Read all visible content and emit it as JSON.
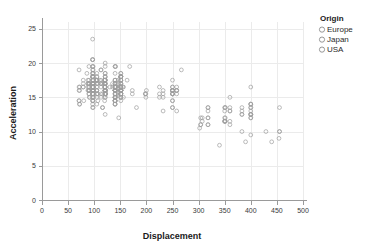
{
  "chart_data": {
    "type": "scatter",
    "title": "",
    "xlabel": "Displacement",
    "ylabel": "Acceleration",
    "xlim": [
      0,
      500
    ],
    "ylim": [
      0,
      26
    ],
    "xticks": [
      0,
      50,
      100,
      150,
      200,
      250,
      300,
      350,
      400,
      450,
      500
    ],
    "yticks": [
      0,
      5,
      10,
      15,
      20,
      25
    ],
    "xtick_labels": [
      "0",
      "50",
      "100",
      "150",
      "200",
      "250",
      "300",
      "350",
      "400",
      "450",
      "500"
    ],
    "ytick_labels": [
      "0",
      "5",
      "10",
      "15",
      "20",
      "25"
    ],
    "grid": true,
    "legend_position": "right",
    "legend_title": "Origin",
    "legend_entries": [
      "Europe",
      "Japan",
      "USA"
    ],
    "marker": "open-circle",
    "marker_color": "#9e9e9e",
    "axis_color": "#9a9a9a",
    "grid_color": "#ebebeb",
    "point_count": 392,
    "x": [
      307,
      350,
      318,
      304,
      302,
      429,
      454,
      440,
      455,
      390,
      383,
      340,
      400,
      455,
      113,
      198,
      199,
      200,
      97,
      97,
      110,
      107,
      104,
      121,
      199,
      360,
      307,
      318,
      304,
      97,
      140,
      113,
      98,
      232,
      225,
      250,
      198,
      97,
      80,
      97,
      88,
      304,
      350,
      318,
      351,
      267,
      360,
      400,
      400,
      113,
      97,
      71,
      97,
      113,
      98,
      97,
      97,
      140,
      147,
      400,
      455,
      360,
      351,
      360,
      350,
      318,
      383,
      400,
      400,
      400,
      258,
      140,
      250,
      250,
      250,
      122,
      116,
      79,
      88,
      71,
      72,
      97,
      91,
      113,
      97,
      97,
      98,
      97,
      97,
      97,
      97,
      97,
      97,
      120,
      181,
      250,
      232,
      350,
      400,
      351,
      318,
      383,
      400,
      400,
      258,
      140,
      250,
      250,
      250,
      122,
      116,
      79,
      88,
      71,
      72,
      97,
      91,
      113,
      97,
      98,
      97,
      97,
      140,
      140,
      140,
      140,
      140,
      140,
      140,
      140,
      232,
      225,
      250,
      250,
      258,
      360,
      350,
      351,
      318,
      383,
      400,
      400,
      258,
      140,
      250,
      250,
      250,
      122,
      116,
      79,
      88,
      71,
      72,
      97,
      91,
      113,
      97,
      98,
      97,
      97,
      140,
      98,
      97,
      97,
      97,
      140,
      140,
      140,
      140,
      140,
      140,
      140,
      140,
      232,
      225,
      250,
      250,
      258,
      360,
      350,
      351,
      318,
      383,
      400,
      400,
      258,
      140,
      250,
      250,
      250,
      122,
      116,
      79,
      88,
      71,
      72,
      97,
      91,
      113,
      97,
      98,
      97,
      97,
      140,
      98,
      97,
      97,
      97,
      140,
      140,
      140,
      140,
      155,
      151,
      121,
      121,
      156,
      173,
      173,
      151,
      98,
      151,
      156,
      151,
      105,
      98,
      151,
      140,
      151,
      105,
      98,
      97,
      90,
      90,
      140,
      151,
      140,
      151,
      121,
      121,
      121,
      121,
      141,
      121,
      121,
      151,
      151,
      151,
      105,
      98,
      151,
      146,
      151,
      140,
      105,
      98,
      151,
      140,
      151,
      105,
      98,
      97,
      90,
      90,
      120,
      151,
      140,
      151,
      121,
      121,
      121,
      121,
      141,
      121,
      121,
      151,
      151,
      105,
      98,
      151,
      146,
      151,
      140,
      105,
      98,
      151,
      140,
      151,
      105,
      98,
      97,
      90,
      90,
      120,
      151,
      140,
      151,
      121,
      121,
      121,
      121,
      141,
      121,
      121,
      151,
      163,
      151,
      105,
      98,
      151,
      146,
      151,
      140,
      105,
      98,
      151,
      140,
      151,
      105,
      98,
      97,
      90,
      90,
      120,
      151,
      140,
      151,
      121,
      121,
      121,
      121,
      141,
      121,
      121,
      151,
      168,
      151,
      105,
      98,
      151,
      146,
      151,
      140,
      105,
      98,
      151,
      140,
      151,
      105,
      98,
      97,
      90,
      90,
      120,
      151,
      140,
      151,
      121,
      121,
      121,
      107,
      141,
      121,
      121,
      151,
      135,
      151,
      105,
      98,
      151,
      146,
      151,
      140,
      105,
      98,
      151,
      140,
      151,
      105,
      98,
      97,
      90,
      86,
      120,
      151,
      140,
      151,
      121,
      121,
      121,
      107,
      141,
      121,
      130,
      151,
      135,
      151,
      105,
      98,
      151,
      146,
      151,
      140,
      105,
      98,
      151,
      140,
      151,
      105,
      98,
      97,
      90,
      86,
      120,
      151,
      140,
      151,
      121,
      121,
      121,
      107,
      141,
      121,
      130,
      151,
      135,
      151,
      105,
      98,
      151,
      146,
      151,
      140,
      105,
      98,
      151,
      140,
      151,
      105,
      98,
      97,
      90,
      86,
      120,
      151,
      140,
      151,
      121
    ],
    "y": [
      12.0,
      11.5,
      11.0,
      12.0,
      10.5,
      10.0,
      9.0,
      8.5,
      10.0,
      8.5,
      10.0,
      8.0,
      9.5,
      10.0,
      15.0,
      15.5,
      15.5,
      16.0,
      14.5,
      20.5,
      17.5,
      14.5,
      17.5,
      12.5,
      15.0,
      13.5,
      11.5,
      11.0,
      11.0,
      20.5,
      14.0,
      19.0,
      15.0,
      13.0,
      15.5,
      15.5,
      15.5,
      19.0,
      14.5,
      19.5,
      16.5,
      11.0,
      12.0,
      12.0,
      13.5,
      19.0,
      15.0,
      14.0,
      14.0,
      19.0,
      18.0,
      19.0,
      20.5,
      15.5,
      17.0,
      23.5,
      19.5,
      16.5,
      12.0,
      12.0,
      13.5,
      13.0,
      11.5,
      11.0,
      13.5,
      13.5,
      12.5,
      13.5,
      12.5,
      14.0,
      16.0,
      14.0,
      14.5,
      13.5,
      16.0,
      15.5,
      13.5,
      16.5,
      17.0,
      14.5,
      14.0,
      17.0,
      15.0,
      17.0,
      16.0,
      18.5,
      13.5,
      16.5,
      17.0,
      14.5,
      14.0,
      17.0,
      15.0,
      14.5,
      13.5,
      17.5,
      15.5,
      13.0,
      12.0,
      13.5,
      13.0,
      12.5,
      13.5,
      12.5,
      16.0,
      14.0,
      14.5,
      13.5,
      16.0,
      15.5,
      13.5,
      16.5,
      17.0,
      14.5,
      14.0,
      17.0,
      15.0,
      17.0,
      16.0,
      18.5,
      13.5,
      16.5,
      15.5,
      17.5,
      14.5,
      15.0,
      16.5,
      14.5,
      16.5,
      15.0,
      16.0,
      15.0,
      16.5,
      15.5,
      16.0,
      13.0,
      11.5,
      11.5,
      12.0,
      13.5,
      13.0,
      12.5,
      16.5,
      15.5,
      16.5,
      15.5,
      16.0,
      16.0,
      15.5,
      17.0,
      17.5,
      16.0,
      16.5,
      16.0,
      17.0,
      16.5,
      17.5,
      16.0,
      18.0,
      17.5,
      15.5,
      16.5,
      17.0,
      16.5,
      15.5,
      16.0,
      14.5,
      15.0,
      16.0,
      14.5,
      16.5,
      15.0,
      16.0,
      15.0,
      16.5,
      15.5,
      16.0,
      13.0,
      11.5,
      11.5,
      12.0,
      13.5,
      13.0,
      12.5,
      16.5,
      15.5,
      16.5,
      15.5,
      16.0,
      16.0,
      15.5,
      17.0,
      17.5,
      16.0,
      16.5,
      16.0,
      17.0,
      16.5,
      17.5,
      16.0,
      18.0,
      17.5,
      15.5,
      16.5,
      17.0,
      16.5,
      15.5,
      16.0,
      14.5,
      15.0,
      16.0,
      14.5,
      16.5,
      15.0,
      16.0,
      15.0,
      16.5,
      15.5,
      16.0,
      16.0,
      15.5,
      14.5,
      15.0,
      15.5,
      14.0,
      14.5,
      16.5,
      17.0,
      16.0,
      17.5,
      19.0,
      18.0,
      16.0,
      17.0,
      18.5,
      17.5,
      16.0,
      16.5,
      15.5,
      16.0,
      17.5,
      18.0,
      19.5,
      20.0,
      18.5,
      17.0,
      16.5,
      16.0,
      15.5,
      15.0,
      16.5,
      17.0,
      15.5,
      16.0,
      17.5,
      16.5,
      16.0,
      17.0,
      18.0,
      17.5,
      16.0,
      16.5,
      15.5,
      16.0,
      17.5,
      18.0,
      19.5,
      18.5,
      17.0,
      16.5,
      16.0,
      15.5,
      15.0,
      16.5,
      17.0,
      15.5,
      16.0,
      17.5,
      16.5,
      16.0,
      17.0,
      18.0,
      17.5,
      16.0,
      16.5,
      15.5,
      16.0,
      17.5,
      18.0,
      19.5,
      18.5,
      17.0,
      16.5,
      16.0,
      15.5,
      15.0,
      16.5,
      17.0,
      15.5,
      16.0,
      17.5,
      16.5,
      16.0,
      17.0,
      18.0,
      17.5,
      16.0,
      16.5,
      15.5,
      16.0,
      17.5,
      18.0,
      19.5,
      18.5,
      17.0,
      16.5,
      16.0,
      15.5,
      15.0,
      16.5,
      17.0,
      15.5,
      16.0,
      17.5,
      16.5,
      16.0,
      17.0,
      18.0,
      17.5,
      16.0,
      16.5,
      15.5,
      16.0,
      17.5,
      18.0,
      19.5,
      18.5,
      17.0,
      16.5,
      16.0,
      15.5,
      15.0,
      16.5,
      17.0,
      15.5,
      16.0,
      17.5,
      16.5,
      16.0,
      17.0,
      18.0,
      17.5,
      16.0,
      16.5,
      15.5,
      16.0,
      17.5,
      18.0,
      19.5,
      18.5,
      17.0,
      16.5,
      16.0,
      15.5,
      15.0,
      16.5,
      17.0,
      15.5,
      16.0,
      17.5,
      16.5,
      16.0,
      17.0,
      18.0,
      17.5,
      16.0,
      16.5,
      15.5,
      16.0,
      17.5,
      18.0,
      19.5,
      18.5,
      17.0,
      16.5,
      16.0,
      15.5,
      15.0,
      16.5,
      17.0,
      15.5,
      16.0,
      17.5,
      16.5,
      16.0,
      17.0,
      18.0,
      17.5,
      16.0
    ]
  },
  "legend": {
    "title": "Origin",
    "items": [
      {
        "label": "Europe"
      },
      {
        "label": "Japan"
      },
      {
        "label": "USA"
      }
    ]
  },
  "axes": {
    "x_title": "Displacement",
    "y_title": "Acceleration"
  }
}
